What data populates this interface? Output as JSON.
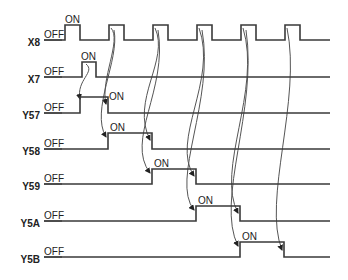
{
  "diagram": {
    "type": "timing-diagram",
    "colors": {
      "line": "#3a3a3a",
      "arrow": "#555555",
      "text": "#222222"
    },
    "x_start": 44,
    "x_end": 330,
    "signals": [
      {
        "name": "X8",
        "off_label": "OFF",
        "on_label": "ON",
        "low_y": 40,
        "high_y": 25,
        "pulses": [
          [
            65,
            80
          ],
          [
            109,
            124
          ],
          [
            153,
            168
          ],
          [
            197,
            212
          ],
          [
            241,
            256
          ],
          [
            285,
            300
          ]
        ],
        "on_label_x": 65
      },
      {
        "name": "X7",
        "off_label": "OFF",
        "on_label": "ON",
        "low_y": 77,
        "high_y": 62,
        "pulses": [
          [
            82,
            96
          ]
        ],
        "on_label_x": 81
      },
      {
        "name": "Y57",
        "off_label": "OFF",
        "on_label": "ON",
        "low_y": 113,
        "high_y": 97,
        "pulses": [
          [
            80,
            108
          ]
        ],
        "on_label_x": 109,
        "on_label_y": 100
      },
      {
        "name": "Y58",
        "off_label": "OFF",
        "on_label": "ON",
        "low_y": 149,
        "high_y": 133,
        "pulses": [
          [
            108,
            152
          ]
        ],
        "on_label_x": 110
      },
      {
        "name": "Y59",
        "off_label": "OFF",
        "on_label": "ON",
        "low_y": 184,
        "high_y": 169,
        "pulses": [
          [
            152,
            196
          ]
        ],
        "on_label_x": 154
      },
      {
        "name": "Y5A",
        "off_label": "OFF",
        "on_label": "ON",
        "low_y": 221,
        "high_y": 206,
        "pulses": [
          [
            196,
            240
          ]
        ],
        "on_label_x": 198
      },
      {
        "name": "Y5B",
        "off_label": "OFF",
        "on_label": "ON",
        "low_y": 257,
        "high_y": 242,
        "pulses": [
          [
            240,
            284
          ]
        ],
        "on_label_x": 242
      }
    ],
    "arrows": [
      {
        "from": "X7 rise",
        "to": "Y57 rise",
        "path": "M86,64 C96,72 76,80 80,99"
      },
      {
        "from": "X8 pulse 2",
        "to": "Y57 fall",
        "path": "M111,28 C122,40 100,80 106,104"
      },
      {
        "from": "X8 pulse 2",
        "to": "Y58 rise",
        "path": "M114,30 C120,60 90,110 106,137"
      },
      {
        "from": "X8 pulse 3",
        "to": "Y58 fall",
        "path": "M155,28 C170,60 130,100 150,140"
      },
      {
        "from": "X8 pulse 3",
        "to": "Y59 rise",
        "path": "M158,30 C168,90 125,140 150,173"
      },
      {
        "from": "X8 pulse 4",
        "to": "Y59 fall",
        "path": "M199,28 C218,80 170,140 194,176"
      },
      {
        "from": "X8 pulse 4",
        "to": "Y5A rise",
        "path": "M202,30 C215,100 170,180 194,210"
      },
      {
        "from": "X8 pulse 5",
        "to": "Y5A fall",
        "path": "M243,28 C262,90 215,170 238,213"
      },
      {
        "from": "X8 pulse 5",
        "to": "Y5B rise",
        "path": "M246,30 C258,110 215,200 238,246"
      },
      {
        "from": "X8 pulse 6",
        "to": "Y5B fall",
        "path": "M287,28 C302,100 262,200 282,250"
      }
    ]
  }
}
